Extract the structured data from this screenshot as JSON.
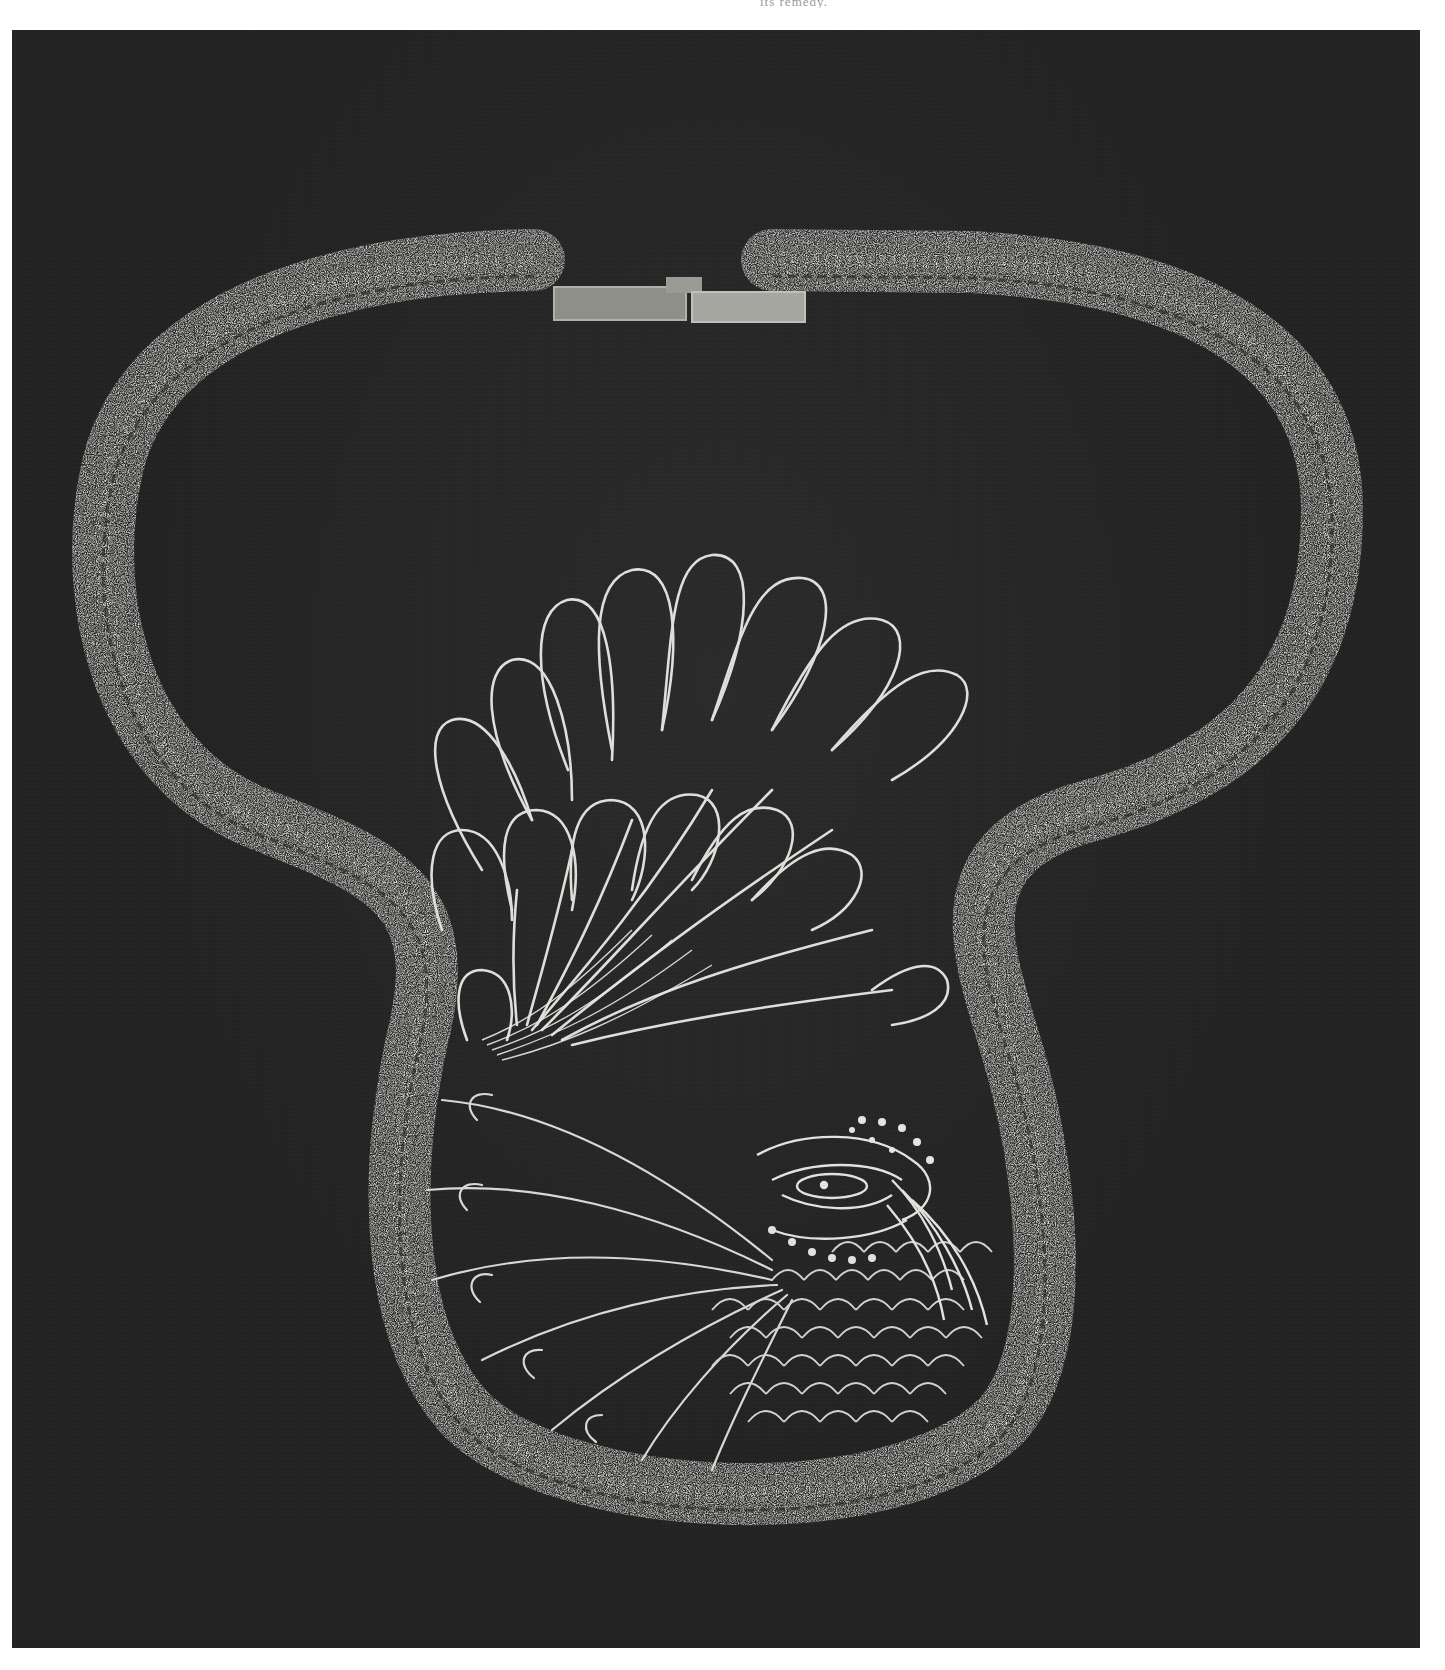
{
  "page": {
    "top_text_fragment": "its remedy."
  },
  "figure": {
    "background_color": "#222222",
    "wire_color": "#d9d9d4",
    "clasp": {
      "type": "rectangular box clasp",
      "color": "#9d9d98"
    },
    "motifs": [
      "collar-rope",
      "clasp",
      "tail-feathers",
      "peacock-head",
      "crest",
      "wing-feathers",
      "breast-scales"
    ]
  }
}
